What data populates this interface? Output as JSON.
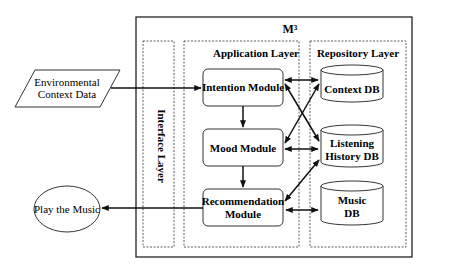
{
  "diagram": {
    "system_title": "M³",
    "layers": {
      "interface": "Interface Layer",
      "application": "Application Layer",
      "repository": "Repository Layer"
    },
    "external": {
      "input_line1": "Environmental",
      "input_line2": "Context Data",
      "output": "Play the Music"
    },
    "modules": {
      "intention": "Intention Module",
      "mood": "Mood Module",
      "recommendation_line1": "Recommendation",
      "recommendation_line2": "Module"
    },
    "databases": {
      "context": "Context DB",
      "listening_line1": "Listening",
      "listening_line2": "History DB",
      "music_line1": "Music",
      "music_line2": "DB"
    }
  }
}
